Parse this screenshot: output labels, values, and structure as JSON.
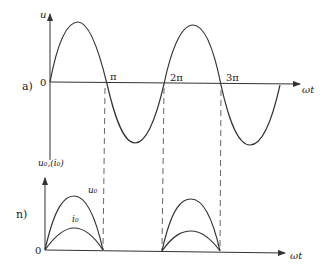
{
  "diagram": {
    "panel_a": {
      "label": "a)",
      "y_axis_label": "u",
      "x_axis_label": "ωt",
      "origin_label": "0",
      "ticks": [
        "π",
        "2π",
        "3π"
      ]
    },
    "panel_b": {
      "label": "n)",
      "y_axis_label": "u₀,(i₀)",
      "x_axis_label": "ωt",
      "origin_label": "0",
      "curve_labels": {
        "u0": "u₀",
        "i0": "i₀"
      }
    },
    "colors": {
      "line": "#333333",
      "dash": "#555555"
    }
  }
}
